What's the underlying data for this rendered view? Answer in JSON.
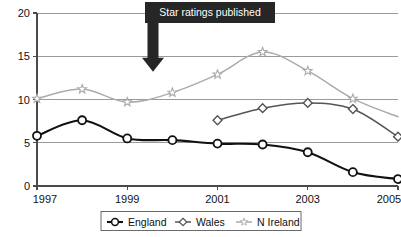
{
  "chart_data": {
    "type": "line",
    "title": "",
    "xlabel": "",
    "ylabel": "",
    "x": [
      1997,
      1998,
      1999,
      2000,
      2001,
      2002,
      2003,
      2004,
      2005
    ],
    "xlim": [
      1997,
      2005
    ],
    "ylim": [
      0,
      20
    ],
    "yticks": [
      0,
      5,
      10,
      15,
      20
    ],
    "ytick_labels": [
      "0",
      "5",
      "10",
      "15",
      "20"
    ],
    "xticks": [
      1997,
      1998,
      1999,
      2000,
      2001,
      2002,
      2003,
      2004,
      2005
    ],
    "xtick_labels": [
      "1997",
      "",
      "1999",
      "",
      "2001",
      "",
      "2003",
      "",
      "2005"
    ],
    "grid": "horizontal",
    "legend_position": "bottom",
    "series": [
      {
        "name": "England",
        "color": "#111111",
        "marker": "circle",
        "x": [
          1997,
          1998,
          1999,
          2000,
          2001,
          2002,
          2003,
          2004,
          2005
        ],
        "values": [
          5.8,
          7.6,
          5.5,
          5.3,
          4.9,
          4.8,
          3.9,
          1.6,
          0.8
        ]
      },
      {
        "name": "Wales",
        "color": "#555555",
        "marker": "diamond",
        "x": [
          2001,
          2002,
          2003,
          2004,
          2005
        ],
        "values": [
          7.6,
          9.0,
          9.6,
          8.9,
          5.7
        ]
      },
      {
        "name": "N Ireland",
        "color": "#ababab",
        "marker": "star",
        "x": [
          1997,
          1998,
          1999,
          2000,
          2001,
          2002,
          2003,
          2004,
          2005
        ],
        "values": [
          10.1,
          11.2,
          9.7,
          10.8,
          12.9,
          15.5,
          13.3,
          10.1,
          8.0
        ]
      }
    ],
    "annotations": [
      {
        "label": "Star ratings published",
        "x": 2001.4,
        "points_to_y": 13.2,
        "box_color": "#262626",
        "text_color": "#ffffff"
      }
    ]
  },
  "legend": {
    "items": [
      {
        "label": "England",
        "marker": "circle",
        "color": "#111111"
      },
      {
        "label": "Wales",
        "marker": "diamond",
        "color": "#555555"
      },
      {
        "label": "N Ireland",
        "marker": "star",
        "color": "#ababab"
      }
    ]
  }
}
